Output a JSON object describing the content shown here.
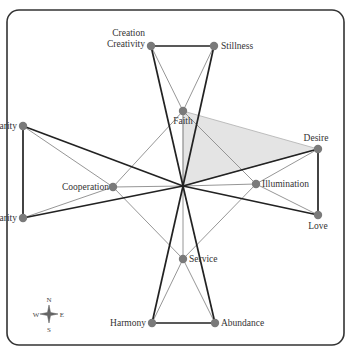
{
  "diagram": {
    "title": "",
    "center": {
      "id": "center",
      "label": ""
    },
    "nodes": [
      {
        "id": "creativity",
        "label_lines": [
          "Creation",
          "Creativity"
        ],
        "ring": "outer"
      },
      {
        "id": "stillness",
        "label_lines": [
          "Stillness"
        ],
        "ring": "outer"
      },
      {
        "id": "faith",
        "label_lines": [
          "Faith"
        ],
        "ring": "inner"
      },
      {
        "id": "charity",
        "label_lines": [
          "Charity"
        ],
        "ring": "outer"
      },
      {
        "id": "desire",
        "label_lines": [
          "Desire"
        ],
        "ring": "outer"
      },
      {
        "id": "cooperation",
        "label_lines": [
          "Cooperation"
        ],
        "ring": "inner"
      },
      {
        "id": "illumination",
        "label_lines": [
          "Illumination"
        ],
        "ring": "inner"
      },
      {
        "id": "clarity",
        "label_lines": [
          "Clarity"
        ],
        "ring": "outer"
      },
      {
        "id": "love",
        "label_lines": [
          "Love"
        ],
        "ring": "outer"
      },
      {
        "id": "service",
        "label_lines": [
          "Service"
        ],
        "ring": "inner"
      },
      {
        "id": "harmony",
        "label_lines": [
          "Harmony"
        ],
        "ring": "outer"
      },
      {
        "id": "abundance",
        "label_lines": [
          "Abundance"
        ],
        "ring": "outer"
      }
    ],
    "edges_thick": [
      [
        "creativity",
        "stillness"
      ],
      [
        "charity",
        "clarity"
      ],
      [
        "desire",
        "love"
      ],
      [
        "harmony",
        "abundance"
      ],
      [
        "center",
        "creativity"
      ],
      [
        "center",
        "stillness"
      ],
      [
        "center",
        "charity"
      ],
      [
        "center",
        "clarity"
      ],
      [
        "center",
        "desire"
      ],
      [
        "center",
        "love"
      ],
      [
        "center",
        "harmony"
      ],
      [
        "center",
        "abundance"
      ]
    ],
    "edges_thin": [
      [
        "faith",
        "creativity"
      ],
      [
        "faith",
        "stillness"
      ],
      [
        "faith",
        "center"
      ],
      [
        "cooperation",
        "charity"
      ],
      [
        "cooperation",
        "clarity"
      ],
      [
        "cooperation",
        "center"
      ],
      [
        "illumination",
        "desire"
      ],
      [
        "illumination",
        "love"
      ],
      [
        "illumination",
        "center"
      ],
      [
        "service",
        "harmony"
      ],
      [
        "service",
        "abundance"
      ],
      [
        "service",
        "center"
      ],
      [
        "faith",
        "illumination"
      ],
      [
        "faith",
        "cooperation"
      ],
      [
        "service",
        "cooperation"
      ],
      [
        "service",
        "illumination"
      ]
    ],
    "highlighted_region": [
      "faith",
      "desire",
      "center"
    ],
    "colors": {
      "node": "#7a7a7a",
      "thick_edge": "#222222",
      "thin_edge": "#8a8a8a",
      "shade": "#e4e4e4"
    }
  },
  "compass": {
    "north": "N",
    "south": "S",
    "east": "E",
    "west": "W"
  }
}
